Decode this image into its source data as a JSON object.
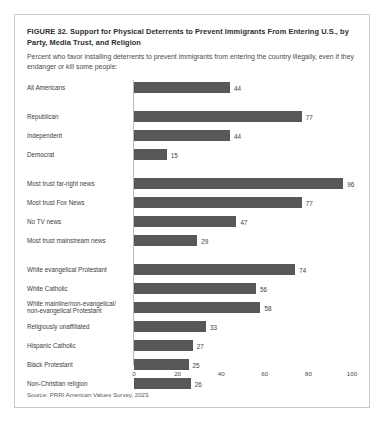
{
  "figure": {
    "title": "FIGURE 32.  Support for Physical Deterrents to Prevent Immigrants From Entering U.S., by Party, Media Trust, and Religion",
    "subtitle": "Percent who favor installing deterrents to prevent immigrants from entering the country illegally, even if they endanger or kill some people:",
    "source": "Source: PRRI American Values Survey, 2023."
  },
  "chart_data": {
    "type": "bar",
    "orientation": "horizontal",
    "title": "FIGURE 32.  Support for Physical Deterrents to Prevent Immigrants From Entering U.S., by Party, Media Trust, and Religion",
    "subtitle": "Percent who favor installing deterrents to prevent immigrants from entering the country illegally, even if they endanger or kill some people:",
    "xlabel": "",
    "ylabel": "",
    "xlim": [
      0,
      100
    ],
    "xticks": [
      0,
      20,
      40,
      60,
      80,
      100
    ],
    "grid": false,
    "legend": false,
    "bar_color": "#585858",
    "categories": [
      "All Americans",
      "Republican",
      "Independent",
      "Democrat",
      "Most trust far-right news",
      "Most trust Fox News",
      "No TV news",
      "Most trust mainstream news",
      "White evangelical Protestant",
      "White Catholic",
      "White mainline/non-evangelical/\nnon-evangelical Protestant",
      "Religiously unaffiliated",
      "Hispanic Catholic",
      "Black Protestant",
      "Non-Christian religion"
    ],
    "values": [
      44,
      77,
      44,
      15,
      96,
      77,
      47,
      29,
      74,
      56,
      58,
      33,
      27,
      25,
      26
    ],
    "group_breaks": [
      1,
      4,
      8
    ],
    "groups": [
      {
        "name": "Overall",
        "categories": [
          "All Americans"
        ],
        "values": [
          44
        ]
      },
      {
        "name": "Party",
        "categories": [
          "Republican",
          "Independent",
          "Democrat"
        ],
        "values": [
          77,
          44,
          15
        ]
      },
      {
        "name": "Media Trust",
        "categories": [
          "Most trust far-right news",
          "Most trust Fox News",
          "No TV news",
          "Most trust mainstream news"
        ],
        "values": [
          96,
          77,
          47,
          29
        ]
      },
      {
        "name": "Religion",
        "categories": [
          "White evangelical Protestant",
          "White Catholic",
          "White mainline/non-evangelical/non-evangelical Protestant",
          "Religiously unaffiliated",
          "Hispanic Catholic",
          "Black Protestant",
          "Non-Christian religion"
        ],
        "values": [
          74,
          56,
          58,
          33,
          27,
          25,
          26
        ]
      }
    ]
  }
}
